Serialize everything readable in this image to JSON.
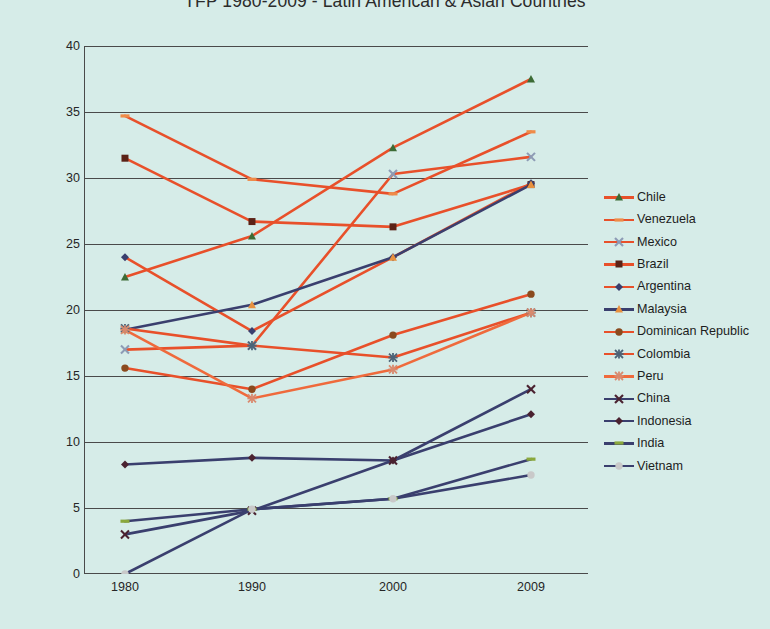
{
  "chart_data": {
    "type": "line",
    "title": "TFP 1980-2009 - Latin American & Asian Countries",
    "xlabel": "",
    "ylabel": "",
    "categories": [
      "1980",
      "1990",
      "2000",
      "2009"
    ],
    "x": [
      1980,
      1990,
      2000,
      2009
    ],
    "ylim": [
      0,
      40
    ],
    "yticks": [
      0,
      5,
      10,
      15,
      20,
      25,
      30,
      35,
      40
    ],
    "grid": true,
    "legend_position": "right",
    "series": [
      {
        "name": "Chile",
        "values": [
          22.5,
          25.6,
          32.3,
          37.5
        ],
        "color": "#e8502a",
        "marker": "triangle",
        "marker_color": "#3c6b35"
      },
      {
        "name": "Venezuela",
        "values": [
          34.7,
          29.9,
          28.8,
          33.5
        ],
        "color": "#e8502a",
        "marker": "dash",
        "marker_color": "#ef8b48"
      },
      {
        "name": "Mexico",
        "values": [
          17.0,
          17.3,
          30.3,
          31.6
        ],
        "color": "#e8502a",
        "marker": "x",
        "marker_color": "#8d9bb5"
      },
      {
        "name": "Brazil",
        "values": [
          31.5,
          26.7,
          26.3,
          29.5
        ],
        "color": "#e8502a",
        "marker": "square",
        "marker_color": "#5b2216"
      },
      {
        "name": "Argentina",
        "values": [
          24.0,
          18.4,
          24.0,
          29.6
        ],
        "color": "#e8502a",
        "marker": "diamond",
        "marker_color": "#3a3f6e"
      },
      {
        "name": "Malaysia",
        "values": [
          18.5,
          20.4,
          24.0,
          29.5
        ],
        "color": "#3a3f6e",
        "marker": "triangle",
        "marker_color": "#e8913f"
      },
      {
        "name": "Dominican Republic",
        "values": [
          15.6,
          14.0,
          18.1,
          21.2
        ],
        "color": "#e8502a",
        "marker": "circle",
        "marker_color": "#8a4a1e"
      },
      {
        "name": "Colombia",
        "values": [
          18.6,
          17.3,
          16.4,
          19.8
        ],
        "color": "#e8502a",
        "marker": "asterisk",
        "marker_color": "#4c6478"
      },
      {
        "name": "Peru",
        "values": [
          18.5,
          13.3,
          15.5,
          19.8
        ],
        "color": "#ef6a3c",
        "marker": "asterisk",
        "marker_color": "#d98a6e"
      },
      {
        "name": "China",
        "values": [
          3.0,
          4.8,
          8.6,
          14.0
        ],
        "color": "#3a3f6e",
        "marker": "x",
        "marker_color": "#4a2230"
      },
      {
        "name": "Indonesia",
        "values": [
          8.3,
          8.8,
          8.6,
          12.1
        ],
        "color": "#3a3f6e",
        "marker": "diamond",
        "marker_color": "#4a2230"
      },
      {
        "name": "India",
        "values": [
          4.0,
          4.9,
          5.7,
          8.7
        ],
        "color": "#3a3f6e",
        "marker": "dash",
        "marker_color": "#8aa83c"
      },
      {
        "name": "Vietnam",
        "values": [
          0.0,
          4.9,
          5.7,
          7.5
        ],
        "color": "#3a3f6e",
        "marker": "circle",
        "marker_color": "#c9c9c9"
      }
    ]
  },
  "legend": {
    "items": [
      "Chile",
      "Venezuela",
      "Mexico",
      "Brazil",
      "Argentina",
      "Malaysia",
      "Dominican Republic",
      "Colombia",
      "Peru",
      "China",
      "Indonesia",
      "India",
      "Vietnam"
    ]
  },
  "colors": {
    "background": "#d6ece8",
    "grid": "#4a4a4a",
    "axis": "#4a4a4a",
    "latin_line": "#e8502a",
    "asian_line": "#3a3f6e"
  }
}
